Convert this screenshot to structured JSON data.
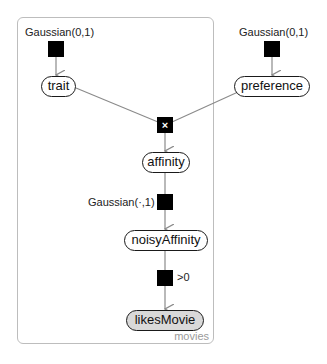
{
  "plate": {
    "label": "movies"
  },
  "factors": {
    "trait_prior": {
      "label": "Gaussian(0,1)",
      "glyph": ""
    },
    "preference_prior": {
      "label": "Gaussian(0,1)",
      "glyph": ""
    },
    "product": {
      "label": "",
      "glyph": "×"
    },
    "noise": {
      "label": "Gaussian(·,1)",
      "glyph": ""
    },
    "threshold": {
      "label": ">0",
      "glyph": ""
    }
  },
  "variables": {
    "trait": {
      "label": "trait",
      "observed": false
    },
    "preference": {
      "label": "preference",
      "observed": false
    },
    "affinity": {
      "label": "affinity",
      "observed": false
    },
    "noisyAffinity": {
      "label": "noisyAffinity",
      "observed": false
    },
    "likesMovie": {
      "label": "likesMovie",
      "observed": true
    }
  },
  "colors": {
    "factor": "#000000",
    "edge": "#8a8a8a",
    "plate_border": "#bdbdbd",
    "observed_fill": "#d9d9d9"
  }
}
